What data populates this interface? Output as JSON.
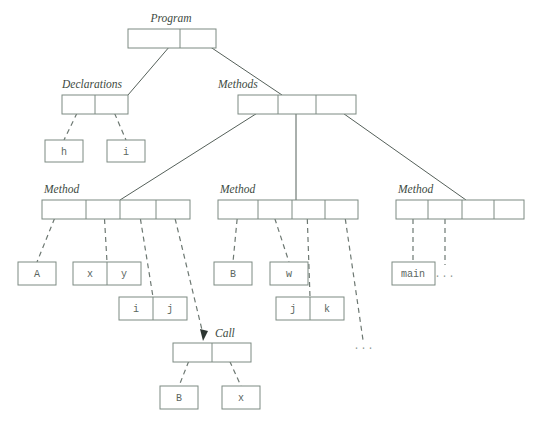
{
  "diagram": {
    "background_color": "#ffffff",
    "line_color": "#55605a",
    "box_stroke_color": "#7d8a82",
    "label_color": "#3d4a42",
    "leaf_text_color": "#5a6660",
    "labels": {
      "program": "Program",
      "declarations": "Declarations",
      "methods": "Methods",
      "method_1": "Method",
      "method_2": "Method",
      "method_3": "Method",
      "call": "Call"
    },
    "leaves": {
      "decl_h": "h",
      "decl_i": "i",
      "m1_A": "A",
      "m1_x": "x",
      "m1_y": "y",
      "m1_i": "i",
      "m1_j": "j",
      "m2_B": "B",
      "m2_w": "w",
      "m2_j": "j",
      "m2_k": "k",
      "m3_main": "main",
      "m3_dots": "...",
      "m2_dots": "...",
      "call_B": "B",
      "call_x": "x"
    },
    "nodes": [
      {
        "name": "program-node",
        "label": "Program",
        "cells": 2,
        "x": 128,
        "y": 29,
        "width": 88,
        "height": 19
      },
      {
        "name": "declarations-node",
        "label": "Declarations",
        "cells": 2,
        "x": 62,
        "y": 95,
        "width": 66,
        "height": 19
      },
      {
        "name": "methods-node",
        "label": "Methods",
        "cells": 3,
        "x": 238,
        "y": 95,
        "width": 118,
        "height": 19
      },
      {
        "name": "method-1-node",
        "label": "Method",
        "cells": 4,
        "x": 42,
        "y": 200,
        "width": 148,
        "height": 19
      },
      {
        "name": "method-2-node",
        "label": "Method",
        "cells": 4,
        "x": 218,
        "y": 200,
        "width": 140,
        "height": 19
      },
      {
        "name": "method-3-node",
        "label": "Method",
        "cells": 4,
        "x": 396,
        "y": 200,
        "width": 128,
        "height": 19
      },
      {
        "name": "call-node",
        "label": "Call",
        "cells": 2,
        "x": 173,
        "y": 343,
        "width": 78,
        "height": 19
      }
    ],
    "leaf_boxes": [
      {
        "name": "leaf-h",
        "text": "h",
        "cells": 1,
        "x": 45,
        "y": 140,
        "width": 38,
        "height": 22
      },
      {
        "name": "leaf-i-decl",
        "text": "i",
        "cells": 1,
        "x": 107,
        "y": 140,
        "width": 38,
        "height": 22
      },
      {
        "name": "leaf-A",
        "text": "A",
        "cells": 1,
        "x": 18,
        "y": 262,
        "width": 38,
        "height": 23
      },
      {
        "name": "leaf-xy",
        "text": "x|y",
        "cells": 2,
        "x": 73,
        "y": 262,
        "width": 68,
        "height": 23
      },
      {
        "name": "leaf-ij",
        "text": "i|j",
        "cells": 2,
        "x": 119,
        "y": 297,
        "width": 68,
        "height": 23
      },
      {
        "name": "leaf-B-m2",
        "text": "B",
        "cells": 1,
        "x": 214,
        "y": 262,
        "width": 38,
        "height": 23
      },
      {
        "name": "leaf-w",
        "text": "w",
        "cells": 1,
        "x": 270,
        "y": 262,
        "width": 38,
        "height": 23
      },
      {
        "name": "leaf-jk",
        "text": "j|k",
        "cells": 2,
        "x": 276,
        "y": 297,
        "width": 68,
        "height": 23
      },
      {
        "name": "leaf-main",
        "text": "main",
        "cells": 1,
        "x": 392,
        "y": 262,
        "width": 43,
        "height": 23
      },
      {
        "name": "leaf-B-call",
        "text": "B",
        "cells": 1,
        "x": 160,
        "y": 386,
        "width": 38,
        "height": 23
      },
      {
        "name": "leaf-x-call",
        "text": "x",
        "cells": 1,
        "x": 222,
        "y": 386,
        "width": 38,
        "height": 23
      }
    ]
  }
}
